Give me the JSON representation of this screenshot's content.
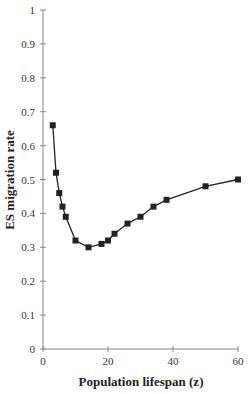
{
  "chart_data": {
    "type": "line",
    "title": "",
    "xlabel": "Population lifespan (z)",
    "ylabel": "ES migration rate",
    "xlim": [
      0,
      60
    ],
    "ylim": [
      0,
      1
    ],
    "x_ticks": [
      "0",
      "20",
      "40",
      "60"
    ],
    "y_ticks": [
      "0",
      "0.1",
      "0.2",
      "0.3",
      "0.4",
      "0.5",
      "0.6",
      "0.7",
      "0.8",
      "0.9",
      "1"
    ],
    "grid": false,
    "legend": null,
    "marker": "square",
    "series": [
      {
        "name": "ES migration rate",
        "x": [
          3,
          4,
          5,
          6,
          7,
          10,
          14,
          18,
          20,
          22,
          26,
          30,
          34,
          38,
          50,
          60
        ],
        "values": [
          0.66,
          0.52,
          0.46,
          0.42,
          0.39,
          0.32,
          0.3,
          0.31,
          0.32,
          0.34,
          0.37,
          0.39,
          0.42,
          0.44,
          0.48,
          0.5
        ]
      }
    ]
  }
}
